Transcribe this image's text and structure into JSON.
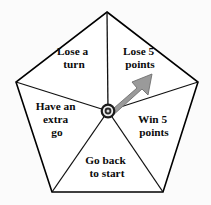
{
  "figure": {
    "kind": "pentagon-spinner",
    "background_color": "#fbfbfb",
    "outline_color": "#000000",
    "face_color": "#ffffff",
    "label_color": "#0b0b0b"
  },
  "spinner": {
    "pointer": {
      "icon_name": "spinner-arrow",
      "fill_color": "#9a9a9a",
      "outline_color": "#6f6f6f",
      "points_to_sector": "Lose 5 points",
      "angle_degrees": 30
    },
    "hub": {
      "icon_name": "spinner-hub",
      "ring_color": "#1a1a1a",
      "core_color": "#d9d9d9"
    },
    "sectors": [
      {
        "id": "lose-a-turn",
        "lines": [
          "Lose a",
          "turn"
        ],
        "position": "top-left",
        "label_x": 74,
        "label_y": 58
      },
      {
        "id": "lose-5-points",
        "lines": [
          "Lose 5",
          "points"
        ],
        "position": "top-right",
        "label_x": 140,
        "label_y": 58
      },
      {
        "id": "have-an-extra-go",
        "lines": [
          "Have an",
          "extra",
          "go"
        ],
        "position": "left",
        "label_x": 57,
        "label_y": 113
      },
      {
        "id": "win-5-points",
        "lines": [
          "Win 5",
          "points"
        ],
        "position": "right",
        "label_x": 154,
        "label_y": 126
      },
      {
        "id": "go-back-to-start",
        "lines": [
          "Go back",
          "to start"
        ],
        "position": "bottom",
        "label_x": 107,
        "label_y": 167
      }
    ]
  },
  "geometry": {
    "vertices": [
      {
        "name": "top",
        "x": 107,
        "y": 12
      },
      {
        "name": "right",
        "x": 198,
        "y": 82
      },
      {
        "name": "bottom-right",
        "x": 163,
        "y": 192
      },
      {
        "name": "bottom-left",
        "x": 52,
        "y": 192
      },
      {
        "name": "left",
        "x": 16,
        "y": 82
      }
    ],
    "center": {
      "x": 108,
      "y": 111
    }
  }
}
